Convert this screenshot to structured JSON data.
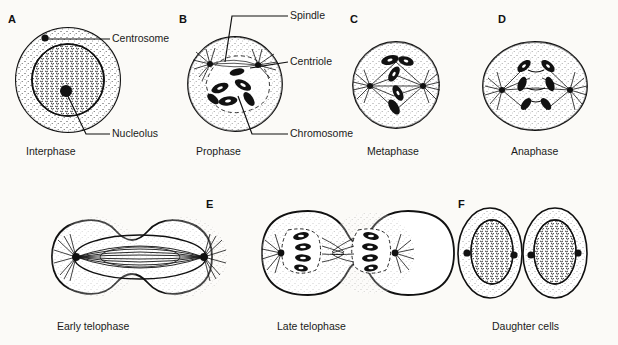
{
  "figure": {
    "background_color": "#fbfaf7",
    "ink_color": "#111111"
  },
  "panels": [
    {
      "letter": "A",
      "caption": "Interphase",
      "letter_x": 8,
      "letter_y": 14,
      "caption_x": 26,
      "caption_y": 146,
      "cell_cx": 68,
      "cell_cy": 80
    },
    {
      "letter": "B",
      "caption": "Prophase",
      "letter_x": 179,
      "letter_y": 14,
      "caption_x": 196,
      "caption_y": 146,
      "cell_cx": 235,
      "cell_cy": 84
    },
    {
      "letter": "C",
      "caption": "Metaphase",
      "letter_x": 350,
      "letter_y": 14,
      "caption_x": 370,
      "caption_y": 146,
      "cell_cx": 396,
      "cell_cy": 85
    },
    {
      "letter": "D",
      "caption": "Anaphase",
      "letter_x": 498,
      "letter_y": 14,
      "caption_x": 513,
      "caption_y": 146,
      "cell_cx": 535,
      "cell_cy": 86
    },
    {
      "letter": "",
      "caption": "Early telophase",
      "letter_x": 0,
      "letter_y": 0,
      "caption_x": 56,
      "caption_y": 321,
      "cell_cx": 94,
      "cell_cy": 257
    },
    {
      "letter": "E",
      "caption": "Late telophase",
      "letter_x": 206,
      "letter_y": 199,
      "caption_x": 276,
      "caption_y": 321,
      "cell_cx": 318,
      "cell_cy": 253
    },
    {
      "letter": "F",
      "caption": "Daughter cells",
      "letter_x": 458,
      "letter_y": 199,
      "caption_x": 493,
      "caption_y": 321,
      "cell_cx": 523,
      "cell_cy": 253
    }
  ],
  "callouts": [
    {
      "label": "Centrosome",
      "text_x": 113,
      "text_y": 36,
      "line_x1": 47,
      "line_y1": 39,
      "line_x2": 110,
      "line_y2": 39
    },
    {
      "label": "Nucleolus",
      "text_x": 113,
      "text_y": 131,
      "line_x1": 66,
      "line_y1": 92,
      "line_x2": 110,
      "line_y2": 134
    },
    {
      "label": "Spindle",
      "text_x": 291,
      "text_y": 12,
      "line_x1": 225,
      "line_y1": 62,
      "line_x2": 288,
      "line_y2": 15
    },
    {
      "label": "Centriole",
      "text_x": 291,
      "text_y": 59,
      "line_x1": 248,
      "line_y1": 68,
      "line_x2": 288,
      "line_y2": 62
    },
    {
      "label": "Chromosome",
      "text_x": 291,
      "text_y": 131,
      "line_x1": 238,
      "line_y1": 96,
      "line_x2": 288,
      "line_y2": 134
    }
  ]
}
